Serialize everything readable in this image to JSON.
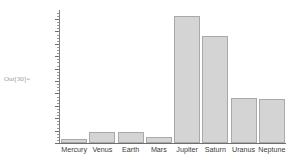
{
  "cell": {
    "out_label": "Out[30]="
  },
  "chart_data": {
    "type": "bar",
    "title": "",
    "xlabel": "",
    "ylabel": "",
    "categories": [
      "Mercury",
      "Venus",
      "Earth",
      "Mars",
      "Jupiter",
      "Saturn",
      "Uranus",
      "Neptune"
    ],
    "values": [
      4879,
      12104,
      12756,
      6792,
      142984,
      120536,
      51118,
      49528
    ],
    "unit": "km",
    "ylim": [
      0,
      150000
    ],
    "grid": false,
    "legend": false,
    "axis_ticks_labeled": false,
    "bar_fill_color": "#d4d4d4",
    "bar_edge_color": "#a9a9a9",
    "axis_color": "#6e6e6e",
    "label_color": "#3c3c3c",
    "background_color": "#ffffff"
  }
}
